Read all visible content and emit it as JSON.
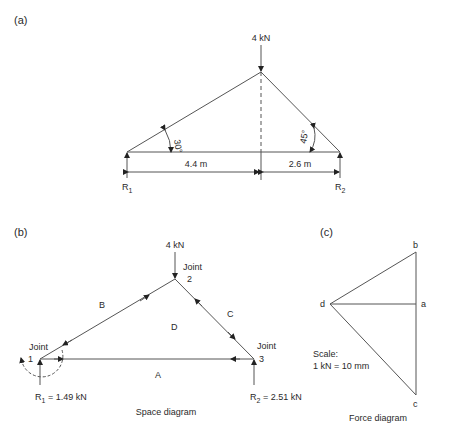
{
  "panel_a": {
    "label": "(a)",
    "load": "4 kN",
    "angle_left": "30°",
    "angle_right": "45°",
    "dim_left": "4.4 m",
    "dim_right": "2.6 m",
    "r1": "R",
    "r1_sub": "1",
    "r2": "R",
    "r2_sub": "2"
  },
  "panel_b": {
    "label": "(b)",
    "load": "4 kN",
    "joint2": "Joint",
    "joint2_num": "2",
    "joint1": "Joint",
    "joint1_num": "1",
    "joint3": "Joint",
    "joint3_num": "3",
    "space_b": "B",
    "space_c": "C",
    "space_d": "D",
    "space_a": "A",
    "r1": "R",
    "r1_sub": "1",
    "r1_val": " = 1.49 kN",
    "r2": "R",
    "r2_sub": "2",
    "r2_val": " = 2.51 kN",
    "caption": "Space diagram"
  },
  "panel_c": {
    "label": "(c)",
    "pt_b": "b",
    "pt_d": "d",
    "pt_a": "a",
    "pt_c": "c",
    "scale_line1": "Scale:",
    "scale_line2": "1 kN = 10 mm",
    "caption": "Force diagram"
  }
}
